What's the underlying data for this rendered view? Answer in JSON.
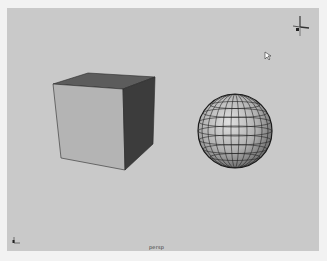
{
  "viewport": {
    "background": "#c9c9c9",
    "camera_label": "persp",
    "objects": [
      {
        "type": "cube",
        "name": "cube"
      },
      {
        "type": "sphere",
        "name": "sphere"
      }
    ]
  },
  "gizmos": {
    "view_axis": "axis-gizmo",
    "origin_axis": "origin-axis-gizmo"
  },
  "colors": {
    "cube_front": "#b4b4b4",
    "cube_top": "#5c5c5c",
    "cube_side": "#3c3c3c",
    "sphere_base": "#b8b8b8",
    "wire": "#222222"
  }
}
